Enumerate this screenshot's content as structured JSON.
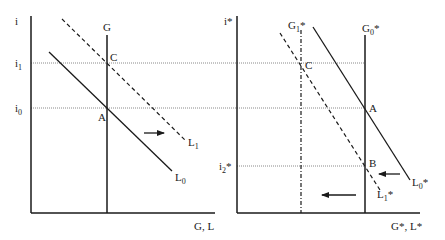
{
  "left_panel": {
    "y_axis_label": "i",
    "x_axis_label": "G, L",
    "rate_labels": {
      "i1": "i",
      "i1_sub": "1",
      "i0": "i",
      "i0_sub": "0"
    },
    "curves": {
      "G": "G",
      "L0": "L",
      "L0_sub": "0",
      "L1": "L",
      "L1_sub": "1"
    },
    "points": {
      "C": "C",
      "A": "A"
    },
    "arrows": [
      {
        "direction": "right"
      }
    ]
  },
  "right_panel": {
    "y_axis_label": "i*",
    "x_axis_label": "G*, L*",
    "rate_labels": {
      "i2": "i",
      "i2_sub": "2",
      "i2_star": "*"
    },
    "curves": {
      "G0": "G",
      "G0_sub": "0",
      "G0_star": "*",
      "G1": "G",
      "G1_sub": "1",
      "G1_star": "*",
      "L0": "L",
      "L0_sub": "0",
      "L0_star": "*",
      "L1": "L",
      "L1_sub": "1",
      "L1_star": "*"
    },
    "points": {
      "C": "C",
      "A": "A",
      "B": "B"
    },
    "arrows": [
      {
        "direction": "left"
      },
      {
        "direction": "left"
      }
    ]
  },
  "colors": {
    "line": "#1a1a1a",
    "dotted": "#8a8a8a",
    "background": "#ffffff"
  }
}
